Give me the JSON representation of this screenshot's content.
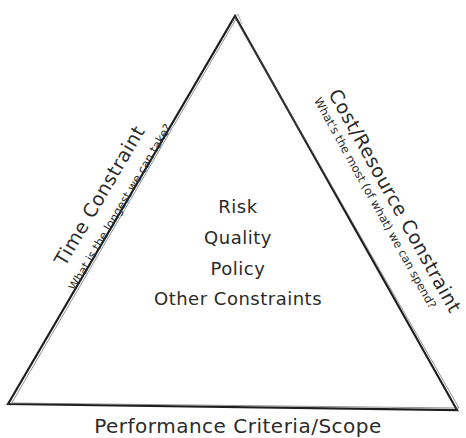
{
  "diagram": {
    "type": "triangle-constraints",
    "left_side": {
      "title": "Time Constraint",
      "subtitle": "What is the longest we can take?"
    },
    "right_side": {
      "title": "Cost/Resource Constraint",
      "subtitle": "What's the most (of what) we can spend?"
    },
    "bottom_side": {
      "title": "Performance Criteria/Scope"
    },
    "center_items": [
      "Risk",
      "Quality",
      "Policy",
      "Other Constraints"
    ],
    "colors": {
      "line": "#1e1e1e",
      "text": "#2b2b2b",
      "background": "#ffffff"
    }
  }
}
